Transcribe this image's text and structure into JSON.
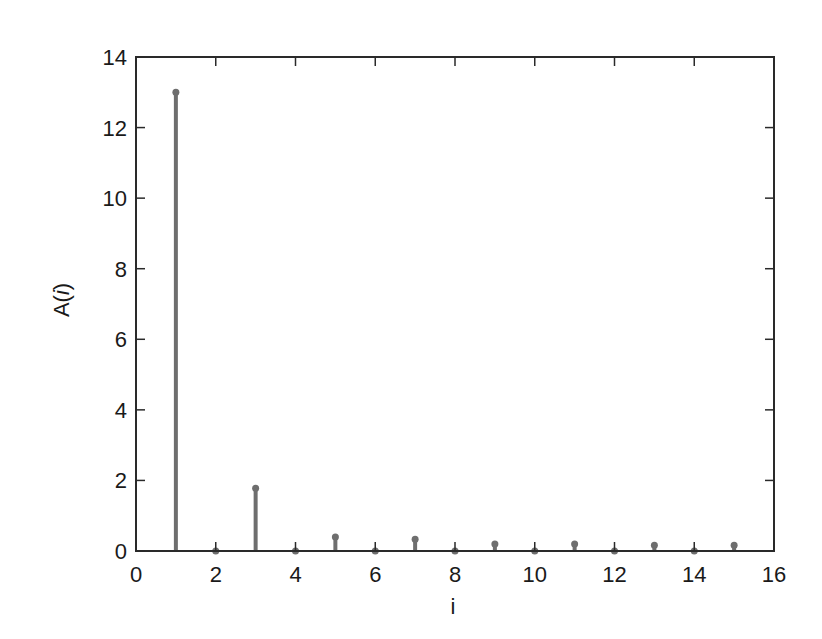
{
  "chart_data": {
    "type": "stem",
    "title": "",
    "xlabel": "i",
    "ylabel": "A(i)",
    "xlim": [
      0,
      16
    ],
    "ylim": [
      0,
      14
    ],
    "xticks": [
      0,
      2,
      4,
      6,
      8,
      10,
      12,
      14,
      16
    ],
    "yticks": [
      0,
      2,
      4,
      6,
      8,
      10,
      12,
      14
    ],
    "grid": false,
    "legend": null,
    "x": [
      1,
      2,
      3,
      4,
      5,
      6,
      7,
      8,
      9,
      10,
      11,
      12,
      13,
      14,
      15
    ],
    "values": [
      13.0,
      0,
      1.78,
      0,
      0.4,
      0,
      0.33,
      0,
      0.2,
      0,
      0.2,
      0,
      0.16,
      0,
      0.16
    ],
    "colors": {
      "stem": "#6e6e6e",
      "axis": "#2a2a2a",
      "text": "#1a1a1a"
    }
  },
  "layout": {
    "plot_left": 136,
    "plot_top": 57,
    "plot_right": 774,
    "plot_bottom": 551
  }
}
